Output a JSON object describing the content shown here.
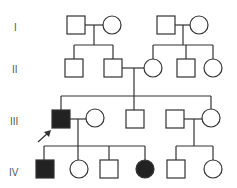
{
  "diagram": {
    "type": "pedigree",
    "colors": {
      "line": "#333333",
      "affected": "#222222",
      "unaffected": "#ffffff"
    },
    "generations": [
      {
        "label": "I",
        "y": 29
      },
      {
        "label": "II",
        "y": 71
      },
      {
        "label": "III",
        "y": 123
      },
      {
        "label": "IV",
        "y": 174
      }
    ],
    "individuals": [
      {
        "id": "I-1",
        "sex": "male",
        "affected": false
      },
      {
        "id": "I-2",
        "sex": "female",
        "affected": false
      },
      {
        "id": "I-3",
        "sex": "male",
        "affected": false
      },
      {
        "id": "I-4",
        "sex": "female",
        "affected": false
      },
      {
        "id": "II-1",
        "sex": "male",
        "affected": false
      },
      {
        "id": "II-2",
        "sex": "male",
        "affected": false
      },
      {
        "id": "II-3",
        "sex": "female",
        "affected": false
      },
      {
        "id": "II-4",
        "sex": "male",
        "affected": false
      },
      {
        "id": "II-5",
        "sex": "female",
        "affected": false
      },
      {
        "id": "III-1",
        "sex": "male",
        "affected": true,
        "proband": true
      },
      {
        "id": "III-2",
        "sex": "female",
        "affected": false
      },
      {
        "id": "III-3",
        "sex": "male",
        "affected": false
      },
      {
        "id": "III-4",
        "sex": "male",
        "affected": false
      },
      {
        "id": "III-5",
        "sex": "female",
        "affected": false
      },
      {
        "id": "IV-1",
        "sex": "male",
        "affected": true
      },
      {
        "id": "IV-2",
        "sex": "female",
        "affected": false
      },
      {
        "id": "IV-3",
        "sex": "male",
        "affected": false
      },
      {
        "id": "IV-4",
        "sex": "female",
        "affected": true
      },
      {
        "id": "IV-5",
        "sex": "male",
        "affected": false
      },
      {
        "id": "IV-6",
        "sex": "female",
        "affected": false
      }
    ],
    "proband_arrow": "arrow-icon"
  }
}
